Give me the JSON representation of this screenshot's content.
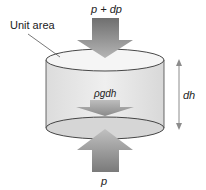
{
  "diagram": {
    "labels": {
      "unit_area": "Unit area",
      "top_force": "p + dp",
      "weight": "ρgdh",
      "height": "dh",
      "bottom_force": "p"
    },
    "colors": {
      "arrow_dark": "#8a8a8a",
      "arrow_light": "#c8c8c8",
      "cylinder_fill": "#e6e6e6",
      "ellipse_fill": "#f4f4f4",
      "bottom_ellipse_fill": "#d9d9d9",
      "outline": "#333333",
      "dh_arrow": "#8c8c8c"
    }
  }
}
